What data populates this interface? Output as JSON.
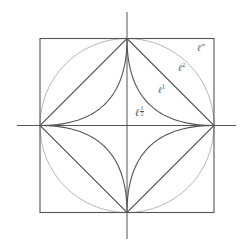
{
  "diagram": {
    "center": [
      127,
      125.5
    ],
    "radius": 87,
    "axes": {
      "x_from": 17,
      "x_to": 236,
      "y_from": 12,
      "y_to": 239,
      "color": "#555555"
    },
    "shapes": [
      {
        "name": "l-infinity-square",
        "norm": "∞",
        "color": "#555555"
      },
      {
        "name": "l2-circle",
        "norm": "2",
        "color": "#b8b8b8"
      },
      {
        "name": "l1-diamond",
        "norm": "1",
        "color": "#555555"
      },
      {
        "name": "l-half-astroid",
        "norm": "1/2",
        "color": "#555555"
      }
    ],
    "labels": [
      {
        "id": "linf",
        "base": "ℓ",
        "exp": "∞",
        "x": 197,
        "y": 42
      },
      {
        "id": "l2",
        "base": "ℓ",
        "exp": "2",
        "x": 178,
        "y": 62
      },
      {
        "id": "l1",
        "base": "ℓ",
        "exp": "1",
        "x": 158,
        "y": 84
      },
      {
        "id": "lhalf",
        "base": "ℓ",
        "exp_num": "1",
        "exp_den": "2",
        "x": 135,
        "y": 106
      }
    ]
  }
}
